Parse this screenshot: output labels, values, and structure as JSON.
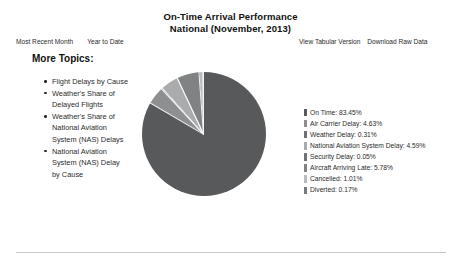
{
  "header": {
    "title_line1": "On-Time Arrival Performance",
    "title_line2": "National (November, 2013)"
  },
  "nav": {
    "left_links": [
      {
        "label": "Most Recent Month"
      },
      {
        "label": "Year to Date"
      }
    ],
    "right_links": [
      {
        "label": "View Tabular Version"
      },
      {
        "label": "Download Raw Data"
      }
    ]
  },
  "sidebar": {
    "heading": "More Topics:",
    "topics": [
      {
        "label": "Flight Delays by Cause"
      },
      {
        "label": "Weather's Share of Delayed Flights"
      },
      {
        "label": "Weather's Share of National Aviation System (NAS) Delays"
      },
      {
        "label": "National Aviation System (NAS) Delay by Cause"
      }
    ]
  },
  "chart_data": {
    "type": "pie",
    "title": "On-Time Arrival Performance National (November, 2013)",
    "unit": "percent",
    "legend_position": "right",
    "start_angle_deg": 0,
    "categories": [
      "On Time",
      "Air Carrier Delay",
      "Weather Delay",
      "National Aviation System Delay",
      "Security Delay",
      "Aircraft Arriving Late",
      "Cancelled",
      "Diverted"
    ],
    "values": [
      83.45,
      4.63,
      0.31,
      4.59,
      0.05,
      5.78,
      1.01,
      0.17
    ],
    "colors": [
      "#58595b",
      "#8d8f91",
      "#6e7072",
      "#a9abad",
      "#6e7072",
      "#808284",
      "#b9bbbd",
      "#77797b"
    ],
    "legend_entries": [
      {
        "label": "On Time: 83.45%",
        "color": "#58595b"
      },
      {
        "label": "Air Carrier Delay: 4.63%",
        "color": "#8d8f91"
      },
      {
        "label": "Weather Delay: 0.31%",
        "color": "#6e7072"
      },
      {
        "label": "National Aviation System Delay: 4.59%",
        "color": "#a9abad"
      },
      {
        "label": "Security Delay: 0.05%",
        "color": "#6e7072"
      },
      {
        "label": "Aircraft Arriving Late: 5.78%",
        "color": "#808284"
      },
      {
        "label": "Cancelled: 1.01%",
        "color": "#b9bbbd"
      },
      {
        "label": "Diverted: 0.17%",
        "color": "#77797b"
      }
    ]
  }
}
